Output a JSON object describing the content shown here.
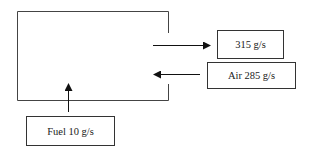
{
  "diagram": {
    "type": "mass-balance",
    "chamber": {
      "label": ""
    },
    "flows": {
      "outlet": {
        "label": "315 g/s",
        "direction": "out"
      },
      "air": {
        "label": "Air 285 g/s",
        "direction": "in"
      },
      "fuel": {
        "label": "Fuel 10 g/s",
        "direction": "in"
      }
    },
    "colors": {
      "line": "#333333",
      "background": "#ffffff"
    }
  }
}
